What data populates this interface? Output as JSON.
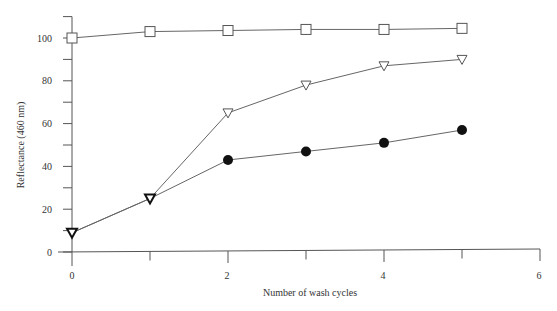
{
  "chart_data": {
    "type": "line",
    "title": "",
    "xlabel": "Number of wash cycles",
    "ylabel": "Reflectance (460 nm)",
    "x": [
      0,
      1,
      2,
      3,
      4,
      5
    ],
    "xlim": [
      0,
      6
    ],
    "ylim": [
      0,
      110
    ],
    "xticks": [
      0,
      2,
      4,
      6
    ],
    "xminor": [
      1,
      3,
      5
    ],
    "yticks": [
      0,
      20,
      40,
      60,
      80,
      100
    ],
    "yminor": [
      10,
      30,
      50,
      70,
      90,
      110
    ],
    "grid": false,
    "legend": "none",
    "series": [
      {
        "name": "open-square",
        "marker": "square-open",
        "values": [
          100,
          103,
          103.5,
          104,
          104,
          104.5
        ]
      },
      {
        "name": "open-triangle",
        "marker": "triangle-down-open",
        "values": [
          9,
          25,
          65,
          78,
          87,
          90
        ]
      },
      {
        "name": "filled-circle",
        "marker": "circle-filled",
        "values": [
          9,
          25,
          43,
          47,
          51,
          57
        ]
      }
    ]
  },
  "labels": {
    "xlabel": "Number of wash cycles",
    "ylabel": "Reflectance (460 nm)",
    "xtick_labels": [
      "0",
      "2",
      "4",
      "6"
    ],
    "ytick_labels": [
      "0",
      "20",
      "40",
      "60",
      "80",
      "100"
    ]
  }
}
